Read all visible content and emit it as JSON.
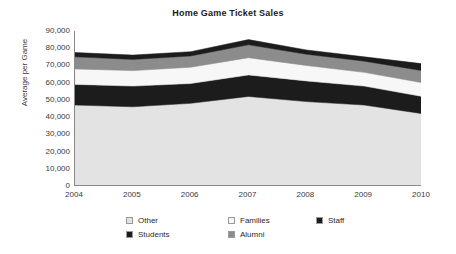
{
  "chart_data": {
    "type": "area",
    "title": "Home Game Ticket Sales",
    "xlabel": "",
    "ylabel": "Average per Game",
    "categories": [
      "2004",
      "2005",
      "2006",
      "2007",
      "2008",
      "2009",
      "2010"
    ],
    "x": [
      2004,
      2005,
      2006,
      2007,
      2008,
      2009,
      2010
    ],
    "ylim": [
      0,
      90000
    ],
    "yticks": [
      "0",
      "10,000",
      "20,000",
      "30,000",
      "40,000",
      "50,000",
      "60,000",
      "70,000",
      "80,000",
      "90,000"
    ],
    "ytick_values": [
      0,
      10000,
      20000,
      30000,
      40000,
      50000,
      60000,
      70000,
      80000,
      90000
    ],
    "stacked": true,
    "grid": false,
    "legend_position": "bottom",
    "series": [
      {
        "name": "Other",
        "color": "#e3e3e3",
        "values": [
          47000,
          46000,
          48000,
          52000,
          49000,
          47000,
          42000
        ]
      },
      {
        "name": "Students",
        "color": "#1c1c1c",
        "values": [
          12000,
          12000,
          11500,
          12500,
          12000,
          11000,
          10000
        ]
      },
      {
        "name": "Families",
        "color": "#f7f7f7",
        "values": [
          9000,
          9000,
          9500,
          10000,
          9000,
          8000,
          8000
        ]
      },
      {
        "name": "Alumni",
        "color": "#8c8c8c",
        "values": [
          7000,
          6500,
          6500,
          7500,
          6500,
          6500,
          7000
        ]
      },
      {
        "name": "Staff",
        "color": "#1c1c1c",
        "values": [
          2500,
          2500,
          2500,
          3000,
          2500,
          2500,
          4000
        ]
      }
    ],
    "cumulative_tops": [
      {
        "name": "Other",
        "values": [
          47000,
          46000,
          48000,
          52000,
          49000,
          47000,
          42000
        ]
      },
      {
        "name": "Students",
        "values": [
          59000,
          58000,
          59500,
          64500,
          61000,
          58000,
          52000
        ]
      },
      {
        "name": "Families",
        "values": [
          68000,
          67000,
          69000,
          74500,
          70000,
          66000,
          60000
        ]
      },
      {
        "name": "Alumni",
        "values": [
          75000,
          73500,
          75500,
          82000,
          76500,
          72500,
          67000
        ]
      },
      {
        "name": "Staff",
        "values": [
          77500,
          76000,
          78000,
          85000,
          79000,
          75000,
          71000
        ]
      }
    ]
  },
  "legend": {
    "items": [
      {
        "label": "Other",
        "color": "#e3e3e3"
      },
      {
        "label": "Families",
        "color": "#f7f7f7"
      },
      {
        "label": "Staff",
        "color": "#1c1c1c"
      },
      {
        "label": "Students",
        "color": "#1c1c1c"
      },
      {
        "label": "Alumni",
        "color": "#8c8c8c"
      }
    ]
  }
}
